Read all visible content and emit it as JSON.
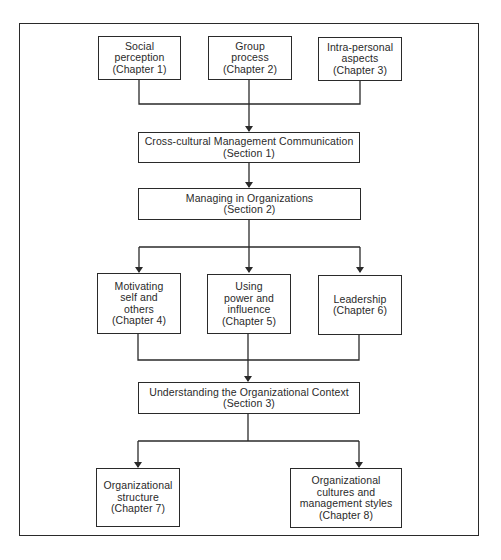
{
  "diagram": {
    "type": "flowchart",
    "colors": {
      "line": "#2a2a2a",
      "background": "#ffffff"
    },
    "nodes": [
      {
        "id": "ch1",
        "lines": [
          "Social",
          "perception",
          "(Chapter 1)"
        ]
      },
      {
        "id": "ch2",
        "lines": [
          "Group",
          "process",
          "(Chapter 2)"
        ]
      },
      {
        "id": "ch3",
        "lines": [
          "Intra-personal",
          "aspects",
          "(Chapter 3)"
        ]
      },
      {
        "id": "sec1",
        "lines": [
          "Cross-cultural Management Communication",
          "(Section 1)"
        ]
      },
      {
        "id": "sec2",
        "lines": [
          "Managing in Organizations",
          "(Section 2)"
        ]
      },
      {
        "id": "ch4",
        "lines": [
          "Motivating",
          "self and",
          "others",
          "(Chapter 4)"
        ]
      },
      {
        "id": "ch5",
        "lines": [
          "Using",
          "power and",
          "influence",
          "(Chapter 5)"
        ]
      },
      {
        "id": "ch6",
        "lines": [
          "Leadership",
          "(Chapter 6)"
        ]
      },
      {
        "id": "sec3",
        "lines": [
          "Understanding the Organizational Context",
          "(Section 3)"
        ]
      },
      {
        "id": "ch7",
        "lines": [
          "Organizational",
          "structure",
          "(Chapter 7)"
        ]
      },
      {
        "id": "ch8",
        "lines": [
          "Organizational",
          "cultures and",
          "management styles",
          "(Chapter 8)"
        ]
      }
    ],
    "edges": [
      {
        "from": [
          "ch1",
          "ch2",
          "ch3"
        ],
        "to": "sec1"
      },
      {
        "from": "sec1",
        "to": "sec2"
      },
      {
        "from": "sec2",
        "to": [
          "ch4",
          "ch5",
          "ch6"
        ]
      },
      {
        "from": [
          "ch4",
          "ch5",
          "ch6"
        ],
        "to": "sec3"
      },
      {
        "from": "sec3",
        "to": [
          "ch7",
          "ch8"
        ]
      }
    ]
  }
}
